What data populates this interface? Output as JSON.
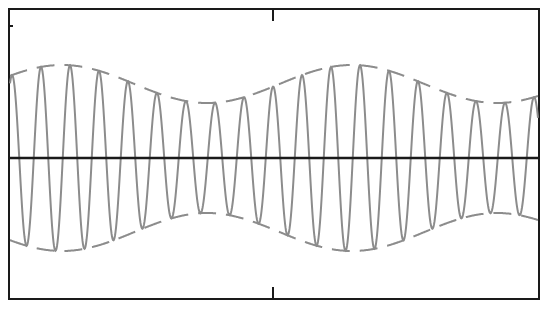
{
  "chart_data": {
    "type": "line",
    "title": "",
    "xlabel": "",
    "ylabel": "",
    "grid": false,
    "legend": [],
    "frame": {
      "left": 9,
      "top": 9,
      "right": 539,
      "bottom": 299
    },
    "center_tick_x": 273,
    "zero_line_y": 158,
    "carrier": {
      "period_px": 29,
      "cycles_visible": 18,
      "phase_peak_x": 12
    },
    "envelope": {
      "period_px": 290,
      "max_amplitude_px": 93,
      "min_amplitude_px": 55,
      "max_at_x": [
        62,
        352
      ],
      "min_at_x": [
        207,
        497
      ]
    },
    "series": [
      {
        "name": "signal",
        "color": "#8a8a8a"
      },
      {
        "name": "upper-envelope",
        "color": "#8a8a8a",
        "style": "dashed"
      },
      {
        "name": "lower-envelope",
        "color": "#8a8a8a",
        "style": "dashed"
      }
    ],
    "colors": {
      "axis": "#1a1a1a",
      "signal": "#8c8c8c",
      "background": "#ffffff"
    }
  }
}
